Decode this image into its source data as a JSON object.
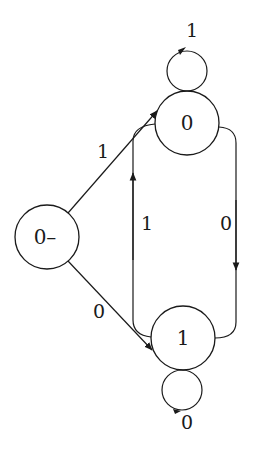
{
  "diagram": {
    "type": "state-transition",
    "nodes": [
      {
        "id": "start",
        "label": "0–"
      },
      {
        "id": "s0",
        "label": "0"
      },
      {
        "id": "s1",
        "label": "1"
      }
    ],
    "edges": [
      {
        "from": "start",
        "to": "s0",
        "label": "1"
      },
      {
        "from": "start",
        "to": "s1",
        "label": "0"
      },
      {
        "from": "s0",
        "to": "s0",
        "label": "1"
      },
      {
        "from": "s0",
        "to": "s1",
        "label": "0"
      },
      {
        "from": "s1",
        "to": "s0",
        "label": "1"
      },
      {
        "from": "s1",
        "to": "s1",
        "label": "0"
      }
    ]
  }
}
